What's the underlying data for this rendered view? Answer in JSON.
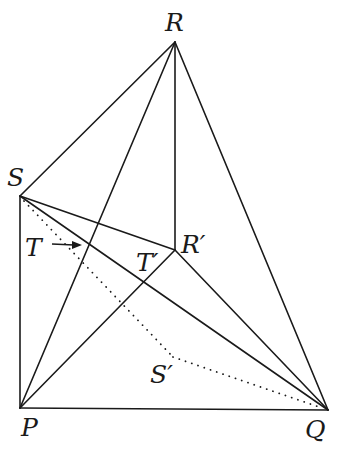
{
  "diagram": {
    "points": {
      "R": {
        "label": "R",
        "x": 175,
        "y": 42
      },
      "S": {
        "label": "S",
        "x": 20,
        "y": 196
      },
      "Rp": {
        "label": "R′",
        "x": 175,
        "y": 250
      },
      "P": {
        "label": "P",
        "x": 20,
        "y": 408
      },
      "Q": {
        "label": "Q",
        "x": 328,
        "y": 410
      },
      "Sp": {
        "label": "S′",
        "x": 173,
        "y": 357
      },
      "T": {
        "label": "T"
      },
      "Tp": {
        "label": "T′"
      }
    },
    "segments_solid": [
      "S-R",
      "R-Q",
      "R-P",
      "R-R′",
      "S-P",
      "P-Q",
      "S-R′",
      "S-Q",
      "P-R′",
      "R′-Q"
    ],
    "segments_dotted": [
      "S-S′",
      "S′-Q"
    ],
    "annotations": [
      {
        "type": "arrow",
        "from_label": "T",
        "points_to": "intersection of S-Q and P-R"
      }
    ]
  }
}
